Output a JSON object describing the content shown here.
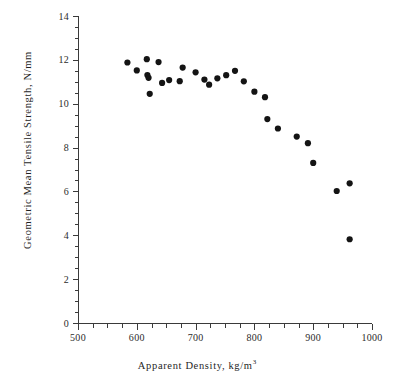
{
  "chart_data": {
    "type": "scatter",
    "title": "",
    "xlabel": "Apparent Density, kg/m³",
    "xlabel_base": "Apparent Density, kg/m",
    "xlabel_exponent": "3",
    "ylabel": "Geometric Mean Tensile Strength, N/mm",
    "xlim": [
      500,
      1000
    ],
    "ylim": [
      0,
      14
    ],
    "x_major_ticks": [
      500,
      600,
      700,
      800,
      900,
      1000
    ],
    "x_tick_labels": [
      "500",
      "600",
      "700",
      "800",
      "900",
      "1000"
    ],
    "x_minor_step": 25,
    "y_major_ticks": [
      0,
      2,
      4,
      6,
      8,
      10,
      12,
      14
    ],
    "y_tick_labels": [
      "0",
      "2",
      "4",
      "6",
      "8",
      "10",
      "12",
      "14"
    ],
    "y_minor_step": 0.5,
    "grid": false,
    "legend": false,
    "marker": "filled-circle",
    "marker_color": "#141414",
    "marker_size_px": 3.1,
    "series": [
      {
        "name": "Tensile strength vs apparent density",
        "points": [
          [
            584,
            11.88
          ],
          [
            600,
            11.52
          ],
          [
            617,
            12.03
          ],
          [
            618,
            11.31
          ],
          [
            620,
            11.18
          ],
          [
            622,
            10.45
          ],
          [
            637,
            11.9
          ],
          [
            643,
            10.95
          ],
          [
            655,
            11.08
          ],
          [
            673,
            11.03
          ],
          [
            678,
            11.65
          ],
          [
            700,
            11.43
          ],
          [
            715,
            11.1
          ],
          [
            723,
            10.87
          ],
          [
            737,
            11.16
          ],
          [
            752,
            11.3
          ],
          [
            767,
            11.5
          ],
          [
            782,
            11.02
          ],
          [
            800,
            10.55
          ],
          [
            818,
            10.3
          ],
          [
            822,
            9.3
          ],
          [
            840,
            8.87
          ],
          [
            872,
            8.5
          ],
          [
            891,
            8.2
          ],
          [
            900,
            7.3
          ],
          [
            940,
            6.02
          ],
          [
            962,
            6.37
          ],
          [
            962,
            3.82
          ]
        ]
      }
    ]
  },
  "axes": {
    "x_title_text": "Apparent Density, kg/m",
    "x_title_sup": "3",
    "y_title_text": "Geometric Mean Tensile Strength, N/mm"
  }
}
